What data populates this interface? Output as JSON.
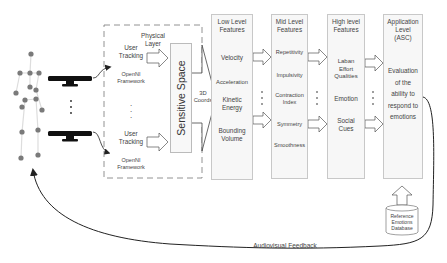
{
  "diagram": {
    "physical_layer": {
      "title_line1": "Physical",
      "title_line2": "Layer",
      "trackers": [
        {
          "tracking_line1": "User",
          "tracking_line2": "Tracking",
          "framework_line1": "OpenNI",
          "framework_line2": "Framework"
        },
        {
          "tracking_line1": "User",
          "tracking_line2": "Tracking",
          "framework_line1": "OpenNI",
          "framework_line2": "Framework"
        }
      ]
    },
    "sensitive_space": {
      "label": "Sensitive Space"
    },
    "coords": {
      "line1": "3D",
      "line2": "Coords"
    },
    "columns": [
      {
        "title_line1": "Low Level",
        "title_line2": "Features",
        "items": [
          "Velocity",
          "Acceleration",
          "Kinetic",
          "Energy",
          "Bounding",
          "Volume"
        ]
      },
      {
        "title_line1": "Mid Level",
        "title_line2": "Features",
        "items": [
          "Repetitivity",
          "Impulsivity",
          "Contraction",
          "Index",
          "Symmetry",
          "Smoothness"
        ]
      },
      {
        "title_line1": "High level",
        "title_line2": "Features",
        "items": [
          "Laban",
          "Effort",
          "Qualities",
          "Emotion",
          "Social",
          "Cues"
        ]
      },
      {
        "title_line1": "Application",
        "title_line2": "Level",
        "title_line3": "(ASC)",
        "items": [
          "Evaluation",
          "of the",
          "ability to",
          "respond to",
          "emotions"
        ]
      }
    ],
    "database": {
      "line1": "Reference",
      "line2": "Emotions",
      "line3": "Database"
    },
    "feedback": {
      "label": "Audiovisual Feedback"
    },
    "icons": [
      "human-skeleton-icon",
      "depth-sensor-icon",
      "database-cylinder-icon",
      "hollow-arrow-icon"
    ],
    "colors": {
      "line": "#222222",
      "box_border": "#c8c8c8",
      "box_fill": "#f7f7f7",
      "joint": "#777777"
    }
  }
}
